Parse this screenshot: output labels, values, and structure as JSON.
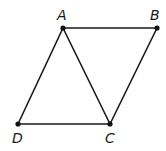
{
  "diagram": {
    "type": "geometry",
    "colors": {
      "stroke": "#1a1a1a",
      "point": "#111111",
      "background": "#ffffff"
    },
    "points": [
      {
        "id": "A",
        "label": "A",
        "x": 63,
        "y": 28,
        "label_x": 57,
        "label_y": 20
      },
      {
        "id": "B",
        "label": "B",
        "x": 157,
        "y": 28,
        "label_x": 150,
        "label_y": 20
      },
      {
        "id": "C",
        "label": "C",
        "x": 110,
        "y": 124,
        "label_x": 105,
        "label_y": 143
      },
      {
        "id": "D",
        "label": "D",
        "x": 18,
        "y": 124,
        "label_x": 12,
        "label_y": 143
      }
    ],
    "segments": [
      {
        "from": "A",
        "to": "B"
      },
      {
        "from": "B",
        "to": "C"
      },
      {
        "from": "C",
        "to": "D"
      },
      {
        "from": "D",
        "to": "A"
      },
      {
        "from": "A",
        "to": "C"
      }
    ]
  }
}
